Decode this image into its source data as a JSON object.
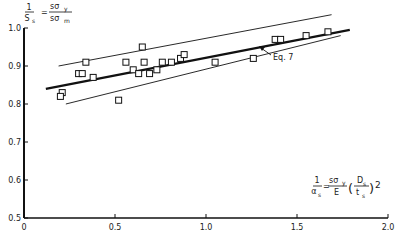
{
  "chart_data": {
    "type": "scatter",
    "title": "",
    "ylabel": "1/S_s = sσ_y / sσ_m",
    "ylabel_parts": {
      "lhs_num": "1",
      "lhs_den": "S",
      "lhs_sub": "s",
      "eq": "=",
      "num": "sσ",
      "num_sub": "y",
      "den": "sσ",
      "den_sub": "m"
    },
    "xlabel": "1/α_s = (sσ_y / E)(D_s / t_s)^2",
    "xlabel_parts": {
      "lhs_num": "1",
      "lhs_den": "α",
      "lhs_sub": "s",
      "eq": "=",
      "num": "sσ",
      "num_sub": "y",
      "den": "E",
      "p_num": "D",
      "p_num_sub": "s",
      "p_den": "t",
      "p_den_sub": "s",
      "exp": "2"
    },
    "xlim": [
      0,
      2.0
    ],
    "ylim": [
      0.5,
      1.0
    ],
    "x_ticks": [
      "0",
      "0.5",
      "1.0",
      "1.5",
      "2.0"
    ],
    "y_ticks": [
      "0.5",
      "0.6",
      "0.7",
      "0.8",
      "0.9",
      "1.0"
    ],
    "grid": false,
    "annotation": "Eq. 7",
    "series": [
      {
        "name": "Test data",
        "marker": "open-square",
        "points": [
          [
            0.21,
            0.83
          ],
          [
            0.2,
            0.82
          ],
          [
            0.3,
            0.88
          ],
          [
            0.32,
            0.88
          ],
          [
            0.34,
            0.91
          ],
          [
            0.38,
            0.87
          ],
          [
            0.52,
            0.81
          ],
          [
            0.56,
            0.91
          ],
          [
            0.6,
            0.89
          ],
          [
            0.63,
            0.88
          ],
          [
            0.65,
            0.95
          ],
          [
            0.66,
            0.91
          ],
          [
            0.69,
            0.88
          ],
          [
            0.73,
            0.89
          ],
          [
            0.76,
            0.91
          ],
          [
            0.81,
            0.91
          ],
          [
            0.86,
            0.92
          ],
          [
            0.88,
            0.93
          ],
          [
            1.05,
            0.91
          ],
          [
            1.26,
            0.92
          ],
          [
            1.38,
            0.97
          ],
          [
            1.41,
            0.97
          ],
          [
            1.55,
            0.98
          ],
          [
            1.67,
            0.99
          ]
        ]
      },
      {
        "name": "Eq. 7",
        "style": "bold-line",
        "points": [
          [
            0.12,
            0.84
          ],
          [
            1.79,
            0.995
          ]
        ]
      },
      {
        "name": "Upper bound",
        "style": "thin-line",
        "points": [
          [
            0.19,
            0.9
          ],
          [
            1.69,
            1.035
          ]
        ]
      },
      {
        "name": "Lower bound",
        "style": "thin-line",
        "points": [
          [
            0.23,
            0.8
          ],
          [
            1.74,
            0.98
          ]
        ]
      }
    ]
  }
}
